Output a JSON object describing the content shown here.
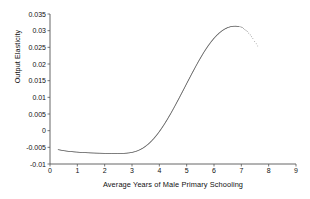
{
  "chart_data": {
    "type": "scatter",
    "title": "",
    "xlabel": "Average Years of Male Primary Schooling",
    "ylabel": "Output Elasticity",
    "xlim": [
      0,
      9
    ],
    "ylim": [
      -0.01,
      0.035
    ],
    "xticks": [
      "0",
      "1",
      "2",
      "3",
      "4",
      "5",
      "6",
      "7",
      "8",
      "9"
    ],
    "xtick_values": [
      0,
      1,
      2,
      3,
      4,
      5,
      6,
      7,
      8,
      9
    ],
    "yticks": [
      "0.035",
      "0.03",
      "0.025",
      "0.02",
      "0.015",
      "0.01",
      "0.005",
      "0",
      "-0.005",
      "-0.01"
    ],
    "ytick_values": [
      0.035,
      0.03,
      0.025,
      0.02,
      0.015,
      0.01,
      0.005,
      0,
      -0.005,
      -0.01
    ],
    "grid": false,
    "legend": "none",
    "marker_color": "#2b2b2b",
    "axis_color": "#555555",
    "series": [
      {
        "name": "Output elasticity of male primary schooling",
        "x": [
          0.3,
          0.4,
          0.5,
          0.6,
          0.7,
          0.8,
          0.9,
          1.0,
          1.1,
          1.2,
          1.3,
          1.4,
          1.5,
          1.6,
          1.7,
          1.8,
          1.9,
          2.0,
          2.1,
          2.2,
          2.3,
          2.4,
          2.5,
          2.6,
          2.7,
          2.8,
          2.9,
          3.0,
          3.1,
          3.2,
          3.3,
          3.4,
          3.5,
          3.6,
          3.7,
          3.8,
          3.9,
          4.0,
          4.1,
          4.2,
          4.3,
          4.4,
          4.5,
          4.6,
          4.7,
          4.8,
          4.9,
          5.0,
          5.1,
          5.2,
          5.3,
          5.4,
          5.5,
          5.6,
          5.7,
          5.8,
          5.9,
          6.0,
          6.1,
          6.2,
          6.3,
          6.4,
          6.5,
          6.6,
          6.7,
          6.8,
          6.9,
          7.0,
          7.1,
          7.2,
          7.3,
          7.4,
          7.5,
          7.6,
          7.65
        ],
        "y": [
          -0.0057,
          -0.00585,
          -0.006,
          -0.00612,
          -0.00622,
          -0.0063,
          -0.00638,
          -0.00644,
          -0.0065,
          -0.00655,
          -0.0066,
          -0.00664,
          -0.00668,
          -0.00671,
          -0.00674,
          -0.00676,
          -0.00678,
          -0.0068,
          -0.00681,
          -0.00682,
          -0.00683,
          -0.00683,
          -0.00683,
          -0.00682,
          -0.0068,
          -0.00675,
          -0.00666,
          -0.00652,
          -0.00632,
          -0.00604,
          -0.00568,
          -0.00522,
          -0.00466,
          -0.004,
          -0.00322,
          -0.00234,
          -0.00136,
          -0.00028,
          0.0009,
          0.00216,
          0.0035,
          0.0049,
          0.00636,
          0.00786,
          0.0094,
          0.01096,
          0.01254,
          0.01412,
          0.0157,
          0.01726,
          0.0188,
          0.0203,
          0.02174,
          0.02312,
          0.02442,
          0.02562,
          0.02672,
          0.02772,
          0.0286,
          0.02936,
          0.03,
          0.03052,
          0.03092,
          0.03118,
          0.03132,
          0.03134,
          0.03126,
          0.03106,
          0.0306,
          0.0299,
          0.029,
          0.0279,
          0.0266,
          0.0254,
          0.0252
        ]
      }
    ]
  }
}
